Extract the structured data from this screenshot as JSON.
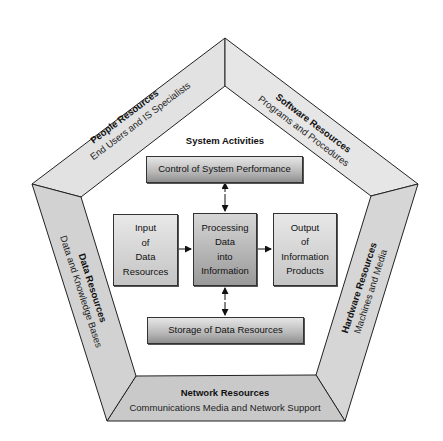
{
  "diagram": {
    "title": "System Activities",
    "colors": {
      "people_face": "#e2e2e2",
      "software_face": "#e6e6e6",
      "data_face": "#d2d2d2",
      "hardware_face": "#d6d6d6",
      "network_face": "#c9c9c9",
      "outline": "#222222"
    },
    "resources": {
      "people": {
        "title": "People Resources",
        "subtitle": "End Users and IS Specialists"
      },
      "software": {
        "title": "Software Resources",
        "subtitle": "Programs and Procedures"
      },
      "data": {
        "title": "Data Resources",
        "subtitle": "Data and Knowledge Bases"
      },
      "hardware": {
        "title": "Hardware Resources",
        "subtitle": "Machines and Media"
      },
      "network": {
        "title": "Network Resources",
        "subtitle": "Communications Media and Network Support"
      }
    },
    "activities": {
      "control": "Control of System Performance",
      "input": [
        "Input",
        "of",
        "Data",
        "Resources"
      ],
      "processing": [
        "Processing",
        "Data",
        "into",
        "Information"
      ],
      "output": [
        "Output",
        "of",
        "Information",
        "Products"
      ],
      "storage": "Storage of Data Resources"
    }
  }
}
